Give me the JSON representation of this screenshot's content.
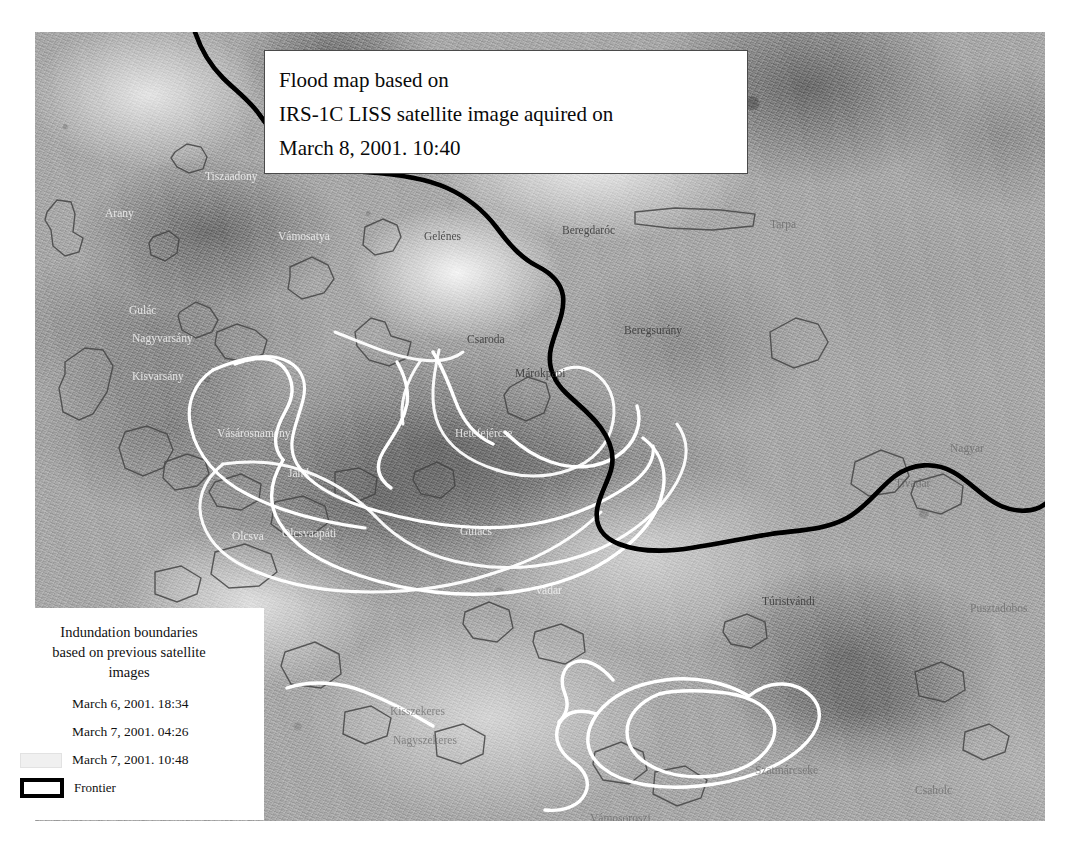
{
  "title_box": {
    "lines": [
      "Flood map based on",
      "IRS-1C LISS satellite image aquired on",
      "March 8, 2001. 10:40"
    ]
  },
  "legend": {
    "heading": "Indundation boundaries based on previous satellite images",
    "heading_lines": [
      "Indundation boundaries",
      "based on previous satellite",
      "images"
    ],
    "items": [
      {
        "swatch": "white-line",
        "label": "March 6, 2001. 18:34"
      },
      {
        "swatch": "white-line",
        "label": "March 7, 2001. 04:26"
      },
      {
        "swatch": "faint-gray-box",
        "label": "March 7, 2001. 10:48"
      },
      {
        "swatch": "black-outline",
        "label": "Frontier"
      }
    ]
  },
  "map": {
    "kind": "greyscale-satellite-image",
    "settlements": [
      {
        "name": "Tiszaadony",
        "x": 170,
        "y": 148,
        "style": "light"
      },
      {
        "name": "Arany",
        "x": 70,
        "y": 185,
        "style": "light"
      },
      {
        "name": "Vámosatya",
        "x": 243,
        "y": 208,
        "style": "light"
      },
      {
        "name": "Gelénes",
        "x": 389,
        "y": 208,
        "style": "dark"
      },
      {
        "name": "Beregdaróc",
        "x": 527,
        "y": 202,
        "style": "dark"
      },
      {
        "name": "Beregsurány",
        "x": 589,
        "y": 302,
        "style": "dark"
      },
      {
        "name": "Csaroda",
        "x": 432,
        "y": 311,
        "style": "dark"
      },
      {
        "name": "Márokpapi",
        "x": 480,
        "y": 345,
        "style": "dark"
      },
      {
        "name": "Gulác",
        "x": 94,
        "y": 282,
        "style": "light"
      },
      {
        "name": "Nagyvarsány",
        "x": 97,
        "y": 310,
        "style": "light"
      },
      {
        "name": "Kisvarsány",
        "x": 97,
        "y": 348,
        "style": "light"
      },
      {
        "name": "Vásárosnamény",
        "x": 182,
        "y": 405,
        "style": "light"
      },
      {
        "name": "Hetefejércse",
        "x": 420,
        "y": 405,
        "style": "light"
      },
      {
        "name": "Jánd",
        "x": 253,
        "y": 445,
        "style": "light"
      },
      {
        "name": "Olcsva",
        "x": 197,
        "y": 508,
        "style": "light"
      },
      {
        "name": "Olcsvaapáti",
        "x": 247,
        "y": 505,
        "style": "light"
      },
      {
        "name": "Gulács",
        "x": 425,
        "y": 503,
        "style": "light"
      },
      {
        "name": "Vadar",
        "x": 500,
        "y": 562,
        "style": "light"
      },
      {
        "name": "Túristvándi",
        "x": 727,
        "y": 573,
        "style": "dark"
      },
      {
        "name": "Tivadar",
        "x": 860,
        "y": 455,
        "style": "faint"
      },
      {
        "name": "Nagyar",
        "x": 915,
        "y": 420,
        "style": "faint"
      },
      {
        "name": "Tarpa",
        "x": 735,
        "y": 196,
        "style": "faint"
      },
      {
        "name": "Kisszekeres",
        "x": 355,
        "y": 683,
        "style": "faint"
      },
      {
        "name": "Nagyszekeres",
        "x": 358,
        "y": 712,
        "style": "faint"
      },
      {
        "name": "Szatmárcseke",
        "x": 720,
        "y": 742,
        "style": "faint"
      },
      {
        "name": "Csaholc",
        "x": 880,
        "y": 762,
        "style": "faint"
      },
      {
        "name": "Vámosoroszi",
        "x": 555,
        "y": 790,
        "style": "faint"
      },
      {
        "name": "Pusztadobos",
        "x": 935,
        "y": 580,
        "style": "faint"
      }
    ],
    "features": {
      "frontier_color": "#000000",
      "inundation_line_color": "#ffffff",
      "settlement_outline_color": "#4b4b4b"
    }
  }
}
